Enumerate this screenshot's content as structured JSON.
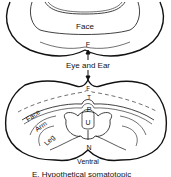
{
  "diagram": {
    "upper_section": {
      "region_label": "Face",
      "marker_label": "F"
    },
    "connector_label": "Eye and Ear",
    "lower_section": {
      "midline_labels": [
        "F",
        "T",
        "P",
        "U",
        "N"
      ],
      "body_labels": {
        "face": "Face",
        "arm": "Arm",
        "leg": "Leg"
      },
      "bottom_label": "Ventral"
    },
    "caption": "E. Hypothetical somatotopic"
  }
}
